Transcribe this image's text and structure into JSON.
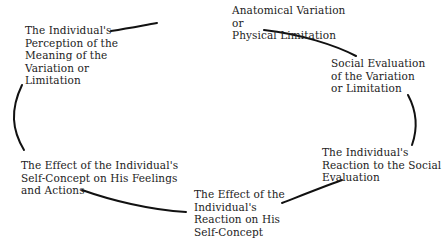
{
  "diagram": {
    "type": "cycle",
    "nodes": [
      {
        "id": "n1",
        "label": "Anatomical Variation\nor\nPhysical Limitation"
      },
      {
        "id": "n2",
        "label": "Social Evaluation\nof the Variation\nor Limitation"
      },
      {
        "id": "n3",
        "label": "The Individual's\nReaction to the Social\nEvaluation"
      },
      {
        "id": "n4",
        "label": "The Effect of the\nIndividual's\nReaction on His\nSelf-Concept"
      },
      {
        "id": "n5",
        "label": "The Effect of the Individual's\nSelf-Concept on His Feelings\nand Actions"
      },
      {
        "id": "n6",
        "label": "The Individual's\nPerception of the\nMeaning of the\nVariation or\nLimitation"
      }
    ],
    "edges": [
      {
        "from": "n1",
        "to": "n2"
      },
      {
        "from": "n2",
        "to": "n3"
      },
      {
        "from": "n3",
        "to": "n4"
      },
      {
        "from": "n4",
        "to": "n5"
      },
      {
        "from": "n5",
        "to": "n6"
      },
      {
        "from": "n6",
        "to": "n1"
      }
    ],
    "colors": {
      "text": "#222222",
      "line": "#111111",
      "background": "#ffffff"
    }
  }
}
